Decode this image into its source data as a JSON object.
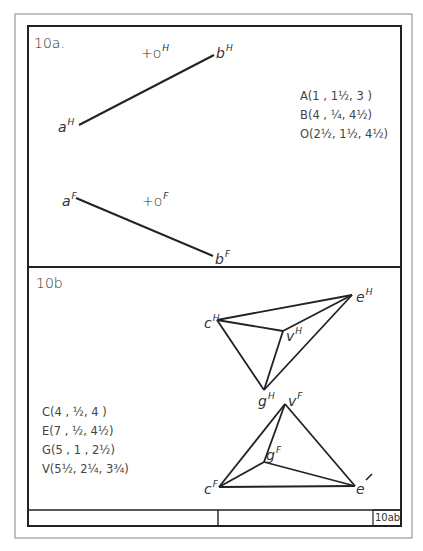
{
  "sheet": {
    "number_label": "10ab",
    "colors": {
      "ink": "#2a2a2a",
      "border_outer": "#8a8a8a",
      "paper": "#ffffff"
    }
  },
  "problem_a": {
    "title": "10a.",
    "coordinates": [
      "A(1 , 1½, 3 )",
      "B(4 , ¼, 4½)",
      "O(2½, 1½, 4½)"
    ],
    "top_view": {
      "labels": {
        "a": "a",
        "b": "b",
        "o": "+o",
        "sup": "H"
      },
      "line_ab": {
        "x1": 79,
        "y1": 125,
        "x2": 214,
        "y2": 55
      },
      "point_o": {
        "x": 155,
        "y": 52
      }
    },
    "front_view": {
      "labels": {
        "a": "a",
        "b": "b",
        "o": "+o",
        "sup": "F"
      },
      "line_ab": {
        "x1": 76,
        "y1": 198,
        "x2": 213,
        "y2": 256
      },
      "point_o": {
        "x": 146,
        "y": 199
      }
    }
  },
  "problem_b": {
    "title": "10b",
    "coordinates": [
      "C(4 , ½, 4 )",
      "E(7 , ½, 4½)",
      "G(5 , 1 , 2½)",
      "V(5½, 2¼, 3¾)"
    ],
    "top_view": {
      "labels": {
        "c": "c",
        "e": "e",
        "g": "g",
        "v": "v",
        "sup": "H"
      },
      "vertices": {
        "c": [
          217,
          320
        ],
        "e": [
          352,
          295
        ],
        "g": [
          264,
          390
        ],
        "v": [
          283,
          331
        ]
      }
    },
    "front_view": {
      "labels": {
        "c": "c",
        "e": "e",
        "g": "g",
        "v": "v",
        "sup": "F"
      },
      "vertices": {
        "c": [
          219,
          487
        ],
        "e": [
          355,
          486
        ],
        "g": [
          264,
          462
        ],
        "v": [
          285,
          404
        ]
      }
    }
  }
}
